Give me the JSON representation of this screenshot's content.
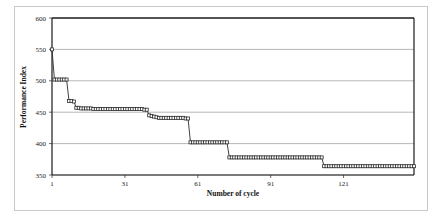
{
  "figure": {
    "background_color": "#ffffff",
    "border_color": "#c9c9c9"
  },
  "chart_data": {
    "type": "line",
    "title": "",
    "subtitle": "",
    "xlabel": "Number of cycle",
    "ylabel": "Performance Index",
    "xlim": [
      1,
      150
    ],
    "ylim": [
      350,
      600
    ],
    "xticks": [
      1,
      31,
      61,
      91,
      121
    ],
    "xtick_labels": [
      "1",
      "31",
      "61",
      "91",
      "121"
    ],
    "yticks": [
      350,
      400,
      450,
      500,
      550,
      600
    ],
    "ytick_labels": [
      "350",
      "400",
      "450",
      "500",
      "550",
      "600"
    ],
    "grid": "horizontal",
    "legend": "none",
    "marker": "open-square",
    "marker_color": "#2b2b2b",
    "line_color": "#2b2b2b",
    "series": [
      {
        "name": "Performance Index",
        "x": [
          1,
          2,
          3,
          4,
          5,
          6,
          7,
          8,
          9,
          10,
          11,
          12,
          13,
          14,
          15,
          16,
          17,
          18,
          19,
          20,
          21,
          22,
          23,
          24,
          25,
          26,
          27,
          28,
          29,
          30,
          31,
          32,
          33,
          34,
          35,
          36,
          37,
          38,
          39,
          40,
          41,
          42,
          43,
          44,
          45,
          46,
          47,
          48,
          49,
          50,
          51,
          52,
          53,
          54,
          55,
          56,
          57,
          58,
          59,
          60,
          61,
          62,
          63,
          64,
          65,
          66,
          67,
          68,
          69,
          70,
          71,
          72,
          73,
          74,
          75,
          76,
          77,
          78,
          79,
          80,
          81,
          82,
          83,
          84,
          85,
          86,
          87,
          88,
          89,
          90,
          91,
          92,
          93,
          94,
          95,
          96,
          97,
          98,
          99,
          100,
          101,
          102,
          103,
          104,
          105,
          106,
          107,
          108,
          109,
          110,
          111,
          112,
          113,
          114,
          115,
          116,
          117,
          118,
          119,
          120,
          121,
          122,
          123,
          124,
          125,
          126,
          127,
          128,
          129,
          130,
          131,
          132,
          133,
          134,
          135,
          136,
          137,
          138,
          139,
          140,
          141,
          142,
          143,
          144,
          145,
          146,
          147,
          148,
          149,
          150
        ],
        "values": [
          550,
          502,
          502,
          502,
          502,
          502,
          502,
          468,
          468,
          467,
          457,
          457,
          456,
          456,
          456,
          456,
          456,
          455,
          455,
          455,
          455,
          455,
          455,
          455,
          455,
          455,
          455,
          455,
          455,
          455,
          455,
          455,
          455,
          455,
          455,
          455,
          455,
          455,
          454,
          454,
          445,
          444,
          443,
          442,
          441,
          441,
          441,
          441,
          441,
          441,
          441,
          441,
          441,
          441,
          441,
          440,
          440,
          402,
          402,
          402,
          402,
          402,
          402,
          402,
          402,
          402,
          402,
          402,
          402,
          402,
          402,
          402,
          402,
          378,
          378,
          378,
          378,
          378,
          378,
          378,
          378,
          378,
          378,
          378,
          378,
          378,
          378,
          378,
          378,
          378,
          378,
          378,
          378,
          378,
          378,
          378,
          378,
          378,
          378,
          378,
          378,
          378,
          378,
          378,
          378,
          378,
          378,
          378,
          378,
          378,
          378,
          378,
          364,
          364,
          364,
          364,
          364,
          364,
          364,
          364,
          364,
          364,
          364,
          364,
          364,
          364,
          364,
          364,
          364,
          364,
          364,
          364,
          364,
          364,
          364,
          364,
          364,
          364,
          364,
          364,
          364,
          364,
          364,
          364,
          364,
          364,
          364,
          364,
          364,
          364
        ]
      }
    ]
  }
}
